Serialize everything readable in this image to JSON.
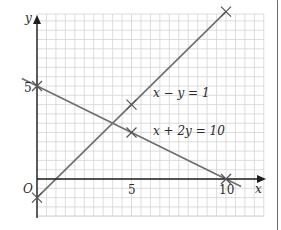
{
  "chart_data": {
    "type": "line",
    "title": "",
    "xlabel": "x",
    "ylabel": "y",
    "origin_label": "O",
    "x_ticks": [
      {
        "value": 5,
        "label": "5"
      },
      {
        "value": 10,
        "label": "10"
      }
    ],
    "y_ticks": [
      {
        "value": 5,
        "label": "5"
      }
    ],
    "xlim": [
      -0.8,
      12
    ],
    "ylim": [
      -2,
      9
    ],
    "grid": true,
    "series": [
      {
        "name": "x − y = 1",
        "label": "x − y = 1",
        "points": [
          [
            0,
            -1
          ],
          [
            5,
            4
          ],
          [
            10,
            9
          ]
        ],
        "marked_points": [
          [
            0,
            -1
          ],
          [
            5,
            4
          ],
          [
            10,
            9
          ]
        ]
      },
      {
        "name": "x + 2y = 10",
        "label": "x + 2y = 10",
        "points": [
          [
            -0.8,
            5.4
          ],
          [
            10.8,
            -0.4
          ]
        ],
        "marked_points": [
          [
            0,
            5
          ],
          [
            5,
            2.5
          ],
          [
            10,
            0
          ]
        ]
      }
    ]
  },
  "labels": {
    "y_axis": "y",
    "x_axis": "x",
    "origin": "O",
    "tick_y5": "5",
    "tick_x5": "5",
    "tick_x10": "10",
    "line1": "x − y = 1",
    "line2": "x + 2y = 10"
  },
  "colors": {
    "grid": "#d4d4d4",
    "axis": "#1e1e1e",
    "line": "#6e6e6e",
    "cross": "#555555",
    "border": "#6a6a6a"
  }
}
